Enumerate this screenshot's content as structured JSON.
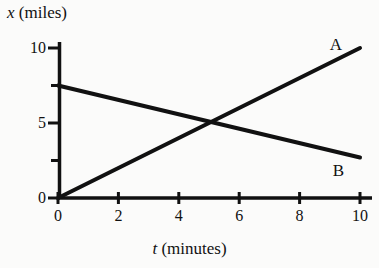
{
  "chart_data": {
    "type": "line",
    "title": "",
    "subtitle": "",
    "xlabel_var": "t",
    "xlabel_unit": " (minutes)",
    "ylabel_var": "x",
    "ylabel_unit": " (miles)",
    "xlim": [
      0,
      10
    ],
    "ylim": [
      0,
      10
    ],
    "grid": false,
    "legend_position": "inline-right",
    "x_ticks": [
      0,
      2,
      4,
      6,
      8,
      10
    ],
    "x_tick_labels": [
      "0",
      "2",
      "4",
      "6",
      "8",
      "10"
    ],
    "y_ticks": [
      0,
      2.5,
      5,
      7.5,
      10
    ],
    "y_tick_labels": [
      "0",
      "",
      "5",
      "",
      "10"
    ],
    "y_major_ticks": [
      0,
      5,
      10
    ],
    "y_minor_ticks": [
      2.5,
      7.5
    ],
    "series": [
      {
        "name": "A",
        "label": "A",
        "color": "#111111",
        "x": [
          0,
          10
        ],
        "values": [
          0,
          10
        ],
        "label_x": 9.0,
        "label_y": 10.3
      },
      {
        "name": "B",
        "label": "B",
        "color": "#111111",
        "x": [
          0,
          10
        ],
        "values": [
          7.5,
          2.7
        ],
        "label_x": 9.1,
        "label_y": 1.9
      }
    ],
    "annotations": [
      {
        "name": "intersection",
        "x": 5,
        "y": 5,
        "visible": false
      }
    ]
  },
  "figure": {
    "background": "#fbfbfa",
    "axis_color": "#111111",
    "line_width_px": 4,
    "axis_width_px": 3
  }
}
